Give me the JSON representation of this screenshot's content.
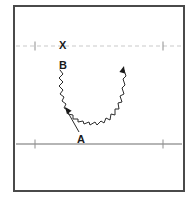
{
  "figure": {
    "background_color": "#ffffff",
    "frame": {
      "name": "outer-frame",
      "x": 14,
      "y": 6,
      "width": 170,
      "height": 185,
      "stroke_color": "#4a4a4a",
      "stroke_width": 2
    },
    "lines": [
      {
        "name": "upper-dashed-line",
        "style": "dashed",
        "color": "#c9c9c9",
        "y": 46,
        "x1": 16,
        "x2": 182,
        "width": 1,
        "dash_pattern": "4 3"
      },
      {
        "name": "lower-solid-line",
        "style": "solid",
        "color": "#9c9c9c",
        "y": 144,
        "x1": 16,
        "x2": 182,
        "width": 1.4,
        "dash_pattern": ""
      }
    ],
    "ticks": [
      {
        "name": "tick-upper-left",
        "x": 35,
        "y": 46,
        "color": "#8f8f8f"
      },
      {
        "name": "tick-upper-right",
        "x": 163,
        "y": 46,
        "color": "#8f8f8f"
      },
      {
        "name": "tick-lower-left",
        "x": 35,
        "y": 144,
        "color": "#8f8f8f"
      },
      {
        "name": "tick-lower-right",
        "x": 163,
        "y": 144,
        "color": "#8f8f8f"
      }
    ],
    "wave": {
      "name": "wavy-u-curve",
      "color": "#2b2b2b",
      "stroke_width": 1,
      "description": "U-shaped wavy (zigzag) trajectory descending on the left, curving along the bottom, and rising on the right ending in an arrowhead",
      "path": "M 60 70 L 63 74 L 59 78 L 63 82 L 59 86 L 63 90 L 60 94 L 64 97 L 62 101 L 66 104 L 64 108 L 69 110 L 68 114 L 73 115 L 73 119 L 78 119 L 78 122 L 83 121 L 84 124 L 89 122 L 90 125 L 95 122 L 97 125 L 101 121 L 104 123 L 106 118 L 110 120 L 111 114 L 115 115 L 115 109 L 119 109 L 118 103 L 122 102 L 120 96 L 124 94 L 122 88 L 125 85 L 123 79 L 126 76 L 124 70"
    },
    "arrows": [
      {
        "name": "wave-end-arrowhead",
        "tip_x": 124,
        "tip_y": 66,
        "angle_deg": -75,
        "color": "#1a1a1a",
        "size": 7
      },
      {
        "name": "leader-line-arrowhead-a",
        "tip_x": 65,
        "tip_y": 107,
        "angle_deg": 232,
        "color": "#1a1a1a",
        "size": 7
      }
    ],
    "leader_lines": [
      {
        "name": "leader-line-a",
        "x1": 79,
        "y1": 132,
        "x2": 66,
        "y2": 109,
        "color": "#2b2b2b",
        "width": 1
      }
    ],
    "labels": [
      {
        "name": "label-x",
        "text": "X",
        "x": 59,
        "y": 49,
        "font_size": 12
      },
      {
        "name": "label-b",
        "text": "B",
        "x": 59,
        "y": 69,
        "font_size": 12
      },
      {
        "name": "label-a",
        "text": "A",
        "x": 77,
        "y": 143,
        "font_size": 12
      }
    ]
  }
}
